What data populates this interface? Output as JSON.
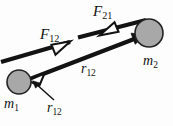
{
  "figure": {
    "background_color": "#fdfdfd",
    "width": 173,
    "height": 126,
    "stroke_color": "#131313",
    "body_fill_color": "#a8a8a8",
    "body_stroke_color": "#232323",
    "arrow_fill_color": "#ffffff"
  },
  "labels": {
    "force_12": {
      "symbol": "F",
      "subscript": "12"
    },
    "force_21": {
      "symbol": "F",
      "subscript": "21"
    },
    "separation_mid": {
      "symbol": "r",
      "subscript": "12"
    },
    "separation_callout": {
      "symbol": "r",
      "subscript": "12"
    },
    "mass_1": {
      "symbol": "m",
      "subscript": "1"
    },
    "mass_2": {
      "symbol": "m",
      "subscript": "2"
    }
  },
  "bodies": [
    {
      "name": "mass-1",
      "label": "m1",
      "cx": 19,
      "cy": 82,
      "r": 12
    },
    {
      "name": "mass-2",
      "label": "m2",
      "cx": 149,
      "cy": 33,
      "r": 14
    }
  ],
  "vectors": [
    {
      "name": "separation-vector-r12",
      "from": "mass-1",
      "to": "mass-2",
      "label": "r12",
      "arrowheads": "both"
    },
    {
      "name": "force-on-1-by-2",
      "label": "F12",
      "direction": "toward-mass-2"
    },
    {
      "name": "force-on-2-by-1",
      "label": "F21",
      "direction": "toward-mass-1"
    }
  ],
  "callout": {
    "name": "r12-callout-leader",
    "points_to": "arrowhead-at-mass-1"
  }
}
